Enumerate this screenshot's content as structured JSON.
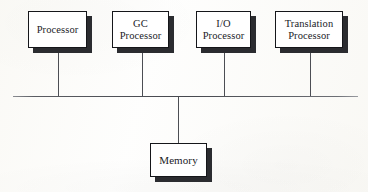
{
  "diagram": {
    "type": "block-diagram",
    "background_color": "#fcfcfa",
    "line_color": "#46484e",
    "box_border_color": "#15161a",
    "box_fill_color": "#ffffff",
    "shadow_color": "#2b2c30",
    "bus": {
      "label": "system-bus",
      "x1": 13,
      "x2": 358,
      "y": 96
    },
    "processors": [
      {
        "id": "processor",
        "label": "Processor",
        "x": 28,
        "y": 11,
        "width": 59,
        "height": 37,
        "connector_x": 58
      },
      {
        "id": "gc-processor",
        "label": "GC\nProcessor",
        "x": 112,
        "y": 11,
        "width": 57,
        "height": 37,
        "connector_x": 141
      },
      {
        "id": "io-processor",
        "label": "I/O\nProcessor",
        "x": 196,
        "y": 11,
        "width": 55,
        "height": 37,
        "connector_x": 223
      },
      {
        "id": "translation-processor",
        "label": "Translation\nProcessor",
        "x": 275,
        "y": 11,
        "width": 68,
        "height": 37,
        "connector_x": 310
      }
    ],
    "memory": {
      "id": "memory",
      "label": "Memory",
      "x": 150,
      "y": 143,
      "width": 57,
      "height": 34,
      "connector_x": 177
    }
  }
}
